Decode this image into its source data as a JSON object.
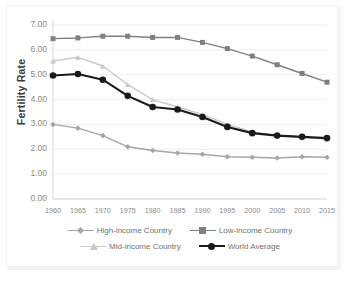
{
  "chart_data": {
    "type": "line",
    "title": "",
    "xlabel": "",
    "ylabel": "Fertility Rate",
    "categories": [
      "1960",
      "1965",
      "1970",
      "1975",
      "1980",
      "1985",
      "1990",
      "1995",
      "2000",
      "2005",
      "2010",
      "2015"
    ],
    "x": [
      1960,
      1965,
      1970,
      1975,
      1980,
      1985,
      1990,
      1995,
      2000,
      2005,
      2010,
      2015
    ],
    "ylim": [
      0.0,
      7.0
    ],
    "yticks": [
      "0.00",
      "1.00",
      "2.00",
      "3.00",
      "4.00",
      "5.00",
      "6.00",
      "7.00"
    ],
    "ytick_values": [
      0,
      1,
      2,
      3,
      4,
      5,
      6,
      7
    ],
    "grid": "horizontal",
    "legend_position": "bottom",
    "series": [
      {
        "name": "High-income Country",
        "color": "#a6a6a6",
        "marker": "diamond",
        "values": [
          3.0,
          2.85,
          2.55,
          2.1,
          1.95,
          1.85,
          1.8,
          1.7,
          1.68,
          1.65,
          1.7,
          1.68
        ]
      },
      {
        "name": "Low-income Country",
        "color": "#808080",
        "marker": "square",
        "values": [
          6.45,
          6.48,
          6.55,
          6.55,
          6.5,
          6.5,
          6.3,
          6.05,
          5.75,
          5.4,
          5.05,
          4.7
        ]
      },
      {
        "name": "Mid-income Country",
        "color": "#c9c9c9",
        "marker": "triangle",
        "values": [
          5.55,
          5.7,
          5.35,
          4.6,
          4.0,
          3.7,
          3.4,
          3.0,
          2.7,
          2.55,
          2.5,
          2.4
        ]
      },
      {
        "name": "World Average",
        "color": "#1a1a1a",
        "marker": "circle",
        "values": [
          4.97,
          5.03,
          4.8,
          4.15,
          3.7,
          3.6,
          3.3,
          2.9,
          2.65,
          2.55,
          2.5,
          2.45
        ]
      }
    ]
  },
  "legend": {
    "items": [
      {
        "label": "High-income Country"
      },
      {
        "label": "Low-income Country"
      },
      {
        "label": "Mid-income Country"
      },
      {
        "label": "World Average"
      }
    ]
  }
}
